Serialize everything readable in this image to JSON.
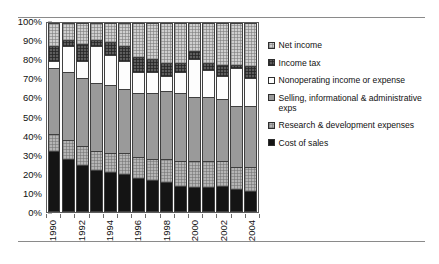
{
  "chart_data": {
    "type": "bar",
    "variant": "100% stacked column",
    "title": "",
    "subtitle": "",
    "xlabel": "",
    "ylabel": "",
    "ylim": [
      0,
      100
    ],
    "yticks": [
      "0%",
      "10%",
      "20%",
      "30%",
      "40%",
      "50%",
      "60%",
      "70%",
      "80%",
      "90%",
      "100%"
    ],
    "grid": false,
    "legend_position": "right",
    "categories": [
      "1990",
      "1991",
      "1992",
      "1993",
      "1994",
      "1995",
      "1996",
      "1997",
      "1998",
      "1999",
      "2000",
      "2001",
      "2002",
      "2003",
      "2004"
    ],
    "xtick_labels_shown": [
      "1990",
      "1992",
      "1994",
      "1996",
      "1998",
      "2000",
      "2002",
      "2004"
    ],
    "series": [
      {
        "name": "Cost of sales",
        "key": "cos",
        "color": "#141414",
        "values": [
          32,
          28,
          25,
          22,
          21,
          20,
          18,
          17,
          16,
          14,
          13,
          13,
          14,
          12,
          11
        ]
      },
      {
        "name": "Research & development expenses",
        "key": "rnd",
        "color": "#b5b5b5",
        "values": [
          9,
          10,
          10,
          10,
          10,
          11,
          11,
          11,
          12,
          13,
          14,
          14,
          13,
          12,
          13
        ]
      },
      {
        "name": "Selling, informational & administrative exps",
        "key": "sga",
        "color": "#9a9a9a",
        "values": [
          35,
          36,
          36,
          36,
          36,
          34,
          34,
          35,
          36,
          36,
          34,
          34,
          33,
          32,
          32
        ]
      },
      {
        "name": "Nonoperating income or expense",
        "key": "nonop",
        "color": "#fdfdfd",
        "values": [
          4,
          14,
          9,
          20,
          16,
          15,
          11,
          11,
          8,
          11,
          20,
          14,
          12,
          20,
          15
        ]
      },
      {
        "name": "Income tax",
        "key": "tax",
        "color": "#5d5d5d",
        "values": [
          8,
          3,
          9,
          3,
          7,
          8,
          8,
          7,
          7,
          5,
          4,
          4,
          6,
          2,
          6
        ]
      },
      {
        "name": "Net income",
        "key": "net",
        "color": "#cfcfcf",
        "values": [
          12,
          9,
          11,
          9,
          10,
          12,
          18,
          19,
          21,
          21,
          15,
          21,
          22,
          22,
          23
        ]
      }
    ],
    "legend_entries": [
      {
        "label": "Net income",
        "key": "net"
      },
      {
        "label": "Income tax",
        "key": "tax"
      },
      {
        "label": "Nonoperating income or expense",
        "key": "nonop"
      },
      {
        "label": "Selling, informational & administrative exps",
        "key": "sga"
      },
      {
        "label": "Research & development expenses",
        "key": "rnd"
      },
      {
        "label": "Cost of sales",
        "key": "cos"
      }
    ]
  }
}
